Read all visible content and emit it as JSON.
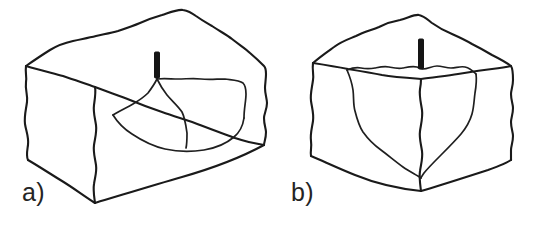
{
  "figure": {
    "background_color": "#ffffff",
    "line_color": "#1a1a1a",
    "marker_color": "#151515",
    "width": 539,
    "height": 226,
    "panels": [
      {
        "id": "a",
        "label": "a)",
        "description": "Hand-drawn isometric rectangular block of rock with a broad shallow crater depression on the top face and a dark vertical marker bar at the crater centre",
        "marker": {
          "name": "borehole-marker",
          "color": "#151515",
          "x": 157,
          "y_top": 52,
          "y_bottom": 78,
          "width": 5
        },
        "block_outline": "M 26,66 L 50,50 L 73,41 L 96,36 L 118,31 L 140,23 L 162,15 L 183,10 L 196,16 L 212,26 L 232,39 L 250,53 L 264,66 L 266,74 L 265,88 L 267,103 L 264,118 L 266,132 L 264,145 L 208,174 L 150,192 L 96,203 L 95,192 L 93,178 L 95,163 L 92,148 L 94,134 L 92,120 L 94,106 L 92,92 L 94,78 L 92,68 Z",
        "top_face_edge": "M 26,66 L 63,76 L 95,87 L 130,100 L 162,112 L 200,125 L 235,138 L 264,145",
        "front_vertical_edge": "M 95,203 L 94,188 L 96,173 L 93,158 L 95,143 L 93,128 L 95,113 L 93,98 L 95,87",
        "crater": [
          "M 157,78 L 149,92 L 137,101 L 122,108 L 112,115",
          "M 112,115 L 126,130 L 143,141 L 163,149 L 186,151 L 209,147 L 226,139 L 238,128 L 243,117",
          "M 157,78 L 175,79 L 196,78 L 214,80 L 231,79 L 243,82 L 246,92 L 243,104 L 243,117",
          "M 157,78 L 163,90 L 172,100 L 181,108 L 185,120 L 187,133 L 186,145"
        ]
      },
      {
        "id": "b",
        "label": "b)",
        "description": "Hand-drawn isometric cubic block of rock with a narrow deep conical crater at the centre of the top face cutting down through the front corner, and a dark vertical marker bar above it",
        "marker": {
          "name": "borehole-marker",
          "color": "#151515",
          "x": 421,
          "y_top": 39,
          "y_bottom": 69,
          "width": 5
        },
        "block_outline": "M 313,63 L 334,47 L 356,36 L 379,27 L 400,20 L 419,15 L 432,23 L 452,34 L 472,44 L 492,55 L 511,66 L 513,80 L 511,94 L 513,108 L 511,122 L 513,136 L 511,150 L 511,160 L 466,177 L 421,191 L 419,177 L 421,163 L 419,149 L 421,135 L 419,121 L 421,107 L 419,93 L 421,79 L 419,70 Z",
        "top_face_edge": "M 313,63 L 345,69 L 378,74 L 402,77 L 421,79 L 450,76 L 478,72 L 511,66",
        "front_vertical_edge": "M 421,191 L 419,176 L 421,161 L 419,146 L 421,131 L 419,116 L 421,101 L 419,86 L 421,79",
        "crater": [
          "M 347,70 L 352,83 L 353,97 L 355,110 L 359,123 L 367,134 L 378,144 L 390,153 L 403,161 L 415,170 L 421,177",
          "M 347,70 L 360,67 L 373,69 L 386,66 L 399,68 L 410,65 L 421,69 L 433,65 L 445,68 L 457,65 L 468,69 L 475,74",
          "M 475,74 L 476,88 L 474,102 L 472,116 L 466,129 L 456,141 L 444,152 L 433,163 L 425,172 L 421,177"
        ]
      }
    ]
  }
}
